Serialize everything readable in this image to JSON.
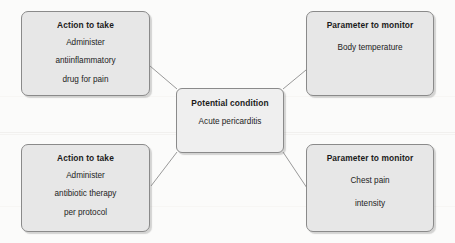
{
  "diagram": {
    "type": "hub-and-spoke clinical decision diagram",
    "center": {
      "header": "Potential condition",
      "body": "Acute pericarditis"
    },
    "nodes": [
      {
        "id": "top-left",
        "header": "Action to take",
        "body": "Administer\nantiinflammatory\ndrug for pain",
        "lines": [
          "Administer",
          "antiinflammatory",
          "drug for pain"
        ]
      },
      {
        "id": "top-right",
        "header": "Parameter to monitor",
        "body": "Body temperature",
        "lines": [
          "Body temperature"
        ]
      },
      {
        "id": "bottom-left",
        "header": "Action to take",
        "body": "Administer\nantibiotic therapy\nper protocol",
        "lines": [
          "Administer",
          "antibiotic therapy",
          "per protocol"
        ]
      },
      {
        "id": "bottom-right",
        "header": "Parameter to monitor",
        "body": "Chest pain\nintensity",
        "lines": [
          "Chest pain",
          "intensity"
        ]
      }
    ],
    "connectors": [
      {
        "from": "center",
        "to": "top-left"
      },
      {
        "from": "center",
        "to": "top-right"
      },
      {
        "from": "center",
        "to": "bottom-left"
      },
      {
        "from": "center",
        "to": "bottom-right"
      }
    ],
    "colors": {
      "background": "#fbfbfa",
      "node_fill": "#e7e7e7",
      "center_fill": "#efefef",
      "node_border": "#8a8a8a",
      "connector": "#8d8d8d",
      "header_text": "#1b1b1b",
      "body_text": "#232323"
    }
  }
}
